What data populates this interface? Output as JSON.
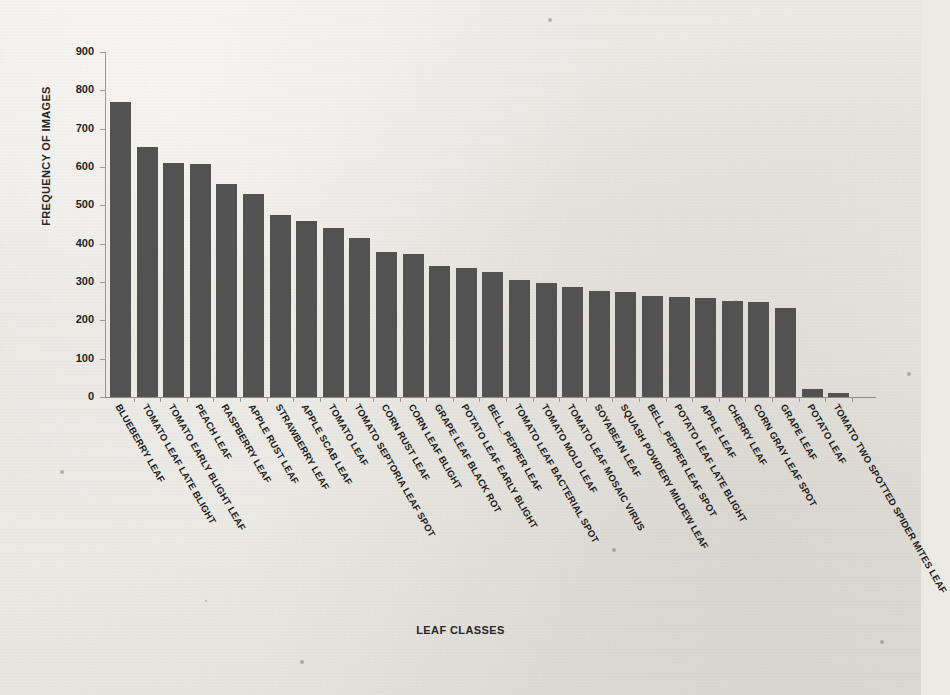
{
  "chart_data": {
    "type": "bar",
    "title": "",
    "xlabel": "LEAF CLASSES",
    "ylabel": "FREQUENCY OF IMAGES",
    "ylim": [
      0,
      900
    ],
    "ytick_labels": [
      "900",
      "800",
      "700",
      "600",
      "500",
      "400",
      "300",
      "200",
      "100",
      "0"
    ],
    "ytick_values": [
      900,
      800,
      700,
      600,
      500,
      400,
      300,
      200,
      100,
      0
    ],
    "grid": false,
    "legend": "none",
    "bar_color": "#4d4d4d",
    "background_color": "#ece9e4",
    "categories": [
      "BLUEBERRY LEAF",
      "TOMATO LEAF LATE BLIGHT",
      "TOMATO EARLY BLIGHT LEAF",
      "PEACH LEAF",
      "RASPBERRY LEAF",
      "APPLE RUST LEAF",
      "STRAWBERRY LEAF",
      "APPLE SCAB LEAF",
      "TOMATO LEAF",
      "TOMATO SEPTORIA LEAF SPOT",
      "CORN RUST LEAF",
      "CORN LEAF BLIGHT",
      "GRAPE LEAF BLACK ROT",
      "POTATO LEAF EARLY BLIGHT",
      "BELL_PEPPER LEAF",
      "TOMATO LEAF BACTERIAL SPOT",
      "TOMATO MOLD LEAF",
      "TOMATO LEAF MOSAIC VIRUS",
      "SOYABEAN LEAF",
      "SQUASH POWDERY MILDEW LEAF",
      "BELL_PEPPER LEAF SPOT",
      "POTATO LEAF LATE BLIGHT",
      "APPLE LEAF",
      "CHERRY LEAF",
      "CORN GRAY LEAF SPOT",
      "GRAPE LEAF",
      "POTATO LEAF",
      "TOMATO TWO SPOTTED SPIDER MITES LEAF"
    ],
    "values": [
      770,
      652,
      610,
      607,
      555,
      529,
      474,
      458,
      440,
      415,
      378,
      372,
      342,
      337,
      325,
      305,
      297,
      288,
      277,
      273,
      263,
      261,
      257,
      251,
      248,
      232,
      20,
      10
    ]
  }
}
